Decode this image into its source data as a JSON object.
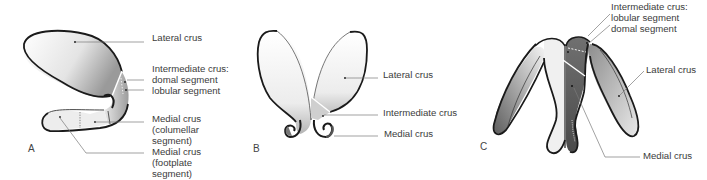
{
  "figure": {
    "panels": [
      {
        "id": "A",
        "letter": "A",
        "labels": {
          "lateral": "Lateral crus",
          "intermediate_1": "Intermediate crus:",
          "intermediate_2": "domal segment",
          "intermediate_3": "lobular segment",
          "medial_col_1": "Medial crus",
          "medial_col_2": "(columellar",
          "medial_col_3": "segment)",
          "medial_foot_1": "Medial crus",
          "medial_foot_2": "(footplate",
          "medial_foot_3": "segment)"
        }
      },
      {
        "id": "B",
        "letter": "B",
        "labels": {
          "lateral": "Lateral crus",
          "intermediate": "Intermediate crus",
          "medial": "Medial crus"
        }
      },
      {
        "id": "C",
        "letter": "C",
        "labels": {
          "intermediate_1": "Intermediate crus:",
          "intermediate_2": "lobular segment",
          "intermediate_3": "domal segment",
          "lateral": "Lateral crus",
          "medial": "Medial crus"
        }
      }
    ],
    "colors": {
      "outline": "#1a1a1a",
      "leader": "#7a7a7a",
      "light_fill": "#f2f2f2",
      "mid_fill": "#a8a8a8",
      "dark_fill": "#5a5a5a"
    }
  }
}
